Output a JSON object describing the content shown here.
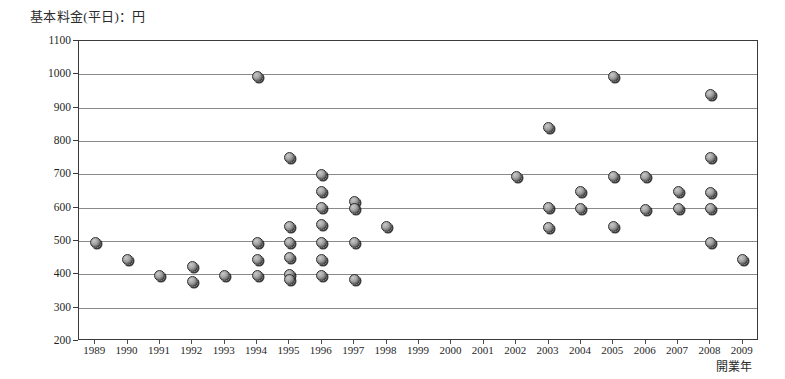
{
  "chart_data": {
    "type": "scatter",
    "title": "基本料金(平日)：円",
    "xlabel": "開業年",
    "ylabel": "基本料金(平日)：円",
    "xlim": [
      1988.5,
      2009.5
    ],
    "ylim": [
      200,
      1100
    ],
    "ytick_step": 100,
    "grid": true,
    "legend": "none",
    "xticks": [
      1989,
      1990,
      1991,
      1992,
      1993,
      1994,
      1995,
      1996,
      1997,
      1998,
      1999,
      2000,
      2001,
      2002,
      2003,
      2004,
      2005,
      2006,
      2007,
      2008,
      2009
    ],
    "yticks": [
      200,
      300,
      400,
      500,
      600,
      700,
      800,
      900,
      1000,
      1100
    ],
    "marker": "filled-circle-gray",
    "points": [
      {
        "x": 1989,
        "y": 495
      },
      {
        "x": 1990,
        "y": 445
      },
      {
        "x": 1991,
        "y": 397
      },
      {
        "x": 1992,
        "y": 425
      },
      {
        "x": 1992,
        "y": 380
      },
      {
        "x": 1993,
        "y": 397
      },
      {
        "x": 1994,
        "y": 995
      },
      {
        "x": 1994,
        "y": 495
      },
      {
        "x": 1994,
        "y": 445
      },
      {
        "x": 1994,
        "y": 397
      },
      {
        "x": 1995,
        "y": 750
      },
      {
        "x": 1995,
        "y": 545
      },
      {
        "x": 1995,
        "y": 495
      },
      {
        "x": 1995,
        "y": 450
      },
      {
        "x": 1995,
        "y": 400
      },
      {
        "x": 1995,
        "y": 385
      },
      {
        "x": 1996,
        "y": 700
      },
      {
        "x": 1996,
        "y": 650
      },
      {
        "x": 1996,
        "y": 600
      },
      {
        "x": 1996,
        "y": 550
      },
      {
        "x": 1996,
        "y": 495
      },
      {
        "x": 1996,
        "y": 445
      },
      {
        "x": 1996,
        "y": 397
      },
      {
        "x": 1997,
        "y": 620
      },
      {
        "x": 1997,
        "y": 598
      },
      {
        "x": 1997,
        "y": 495
      },
      {
        "x": 1997,
        "y": 385
      },
      {
        "x": 1998,
        "y": 545
      },
      {
        "x": 2002,
        "y": 695
      },
      {
        "x": 2003,
        "y": 840
      },
      {
        "x": 2003,
        "y": 600
      },
      {
        "x": 2003,
        "y": 540
      },
      {
        "x": 2004,
        "y": 650
      },
      {
        "x": 2004,
        "y": 598
      },
      {
        "x": 2005,
        "y": 995
      },
      {
        "x": 2005,
        "y": 695
      },
      {
        "x": 2005,
        "y": 545
      },
      {
        "x": 2006,
        "y": 695
      },
      {
        "x": 2006,
        "y": 595
      },
      {
        "x": 2007,
        "y": 650
      },
      {
        "x": 2007,
        "y": 598
      },
      {
        "x": 2008,
        "y": 940
      },
      {
        "x": 2008,
        "y": 750
      },
      {
        "x": 2008,
        "y": 645
      },
      {
        "x": 2008,
        "y": 598
      },
      {
        "x": 2008,
        "y": 495
      },
      {
        "x": 2009,
        "y": 445
      }
    ]
  }
}
